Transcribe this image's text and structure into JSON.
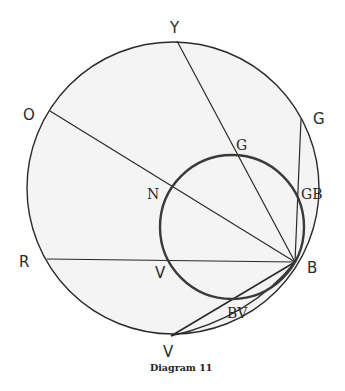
{
  "caption": "Diagram 11",
  "colors": {
    "ink": "#2a2a2a",
    "fill": "#f4f4f4",
    "background": "#ffffff"
  },
  "large_circle": {
    "cx": 173,
    "cy": 188,
    "r": 146
  },
  "small_circle": {
    "cx": 232,
    "cy": 227,
    "r": 72
  },
  "labels": {
    "Y": "Y",
    "O": "O",
    "R": "R",
    "V_outer": "V",
    "G_outer": "G",
    "G_inner": "G",
    "N": "N",
    "V_inner": "V",
    "GB": "GB",
    "B": "B",
    "BV": "BV"
  }
}
